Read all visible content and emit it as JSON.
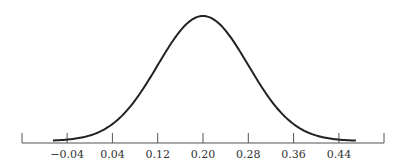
{
  "chart_data": {
    "type": "line",
    "title": "",
    "xlabel": "",
    "ylabel": "",
    "x_ticks": [
      -0.04,
      0.04,
      0.12,
      0.2,
      0.28,
      0.36,
      0.44
    ],
    "x_tick_labels": [
      "−0.04",
      "0.04",
      "0.12",
      "0.20",
      "0.28",
      "0.36",
      "0.44"
    ],
    "xlim": [
      -0.12,
      0.52
    ],
    "curve_range": [
      -0.065,
      0.47
    ],
    "distribution": {
      "family": "normal",
      "mean": 0.2,
      "sd": 0.08
    },
    "grid": false,
    "legend": null,
    "y_axis_shown": false,
    "colors": {
      "curve": "#222222",
      "axis": "#555555",
      "text": "#333333"
    }
  }
}
